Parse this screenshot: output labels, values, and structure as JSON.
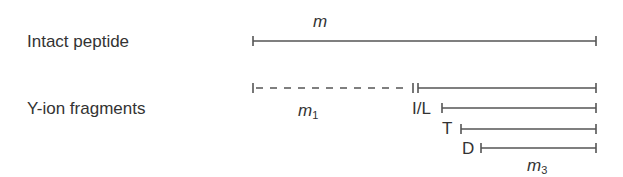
{
  "rows": {
    "intact": {
      "label": "Intact peptide"
    },
    "fragments": {
      "label": "Y-ion fragments"
    }
  },
  "annotations": {
    "m": "m",
    "m1_base": "m",
    "m1_sub": "1",
    "m3_base": "m",
    "m3_sub": "3"
  },
  "residues": [
    {
      "label": "I/L"
    },
    {
      "label": "T"
    },
    {
      "label": "D"
    }
  ],
  "colors": {
    "line": "#555555",
    "text": "#333333",
    "background": "#ffffff"
  }
}
